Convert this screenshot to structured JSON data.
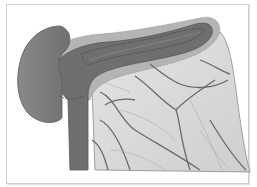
{
  "colors": {
    "background": "#ffffff",
    "frame_border": "#cfcfcf",
    "dark_lobe": "#7d7d7d",
    "dark_tube": "#6f6f6f",
    "tube_inner": "#5e5e5e",
    "fatty_rim": "#b4b4b4",
    "fan_tissue": "#d9d9d9",
    "vessel": "#6a6a6a"
  }
}
